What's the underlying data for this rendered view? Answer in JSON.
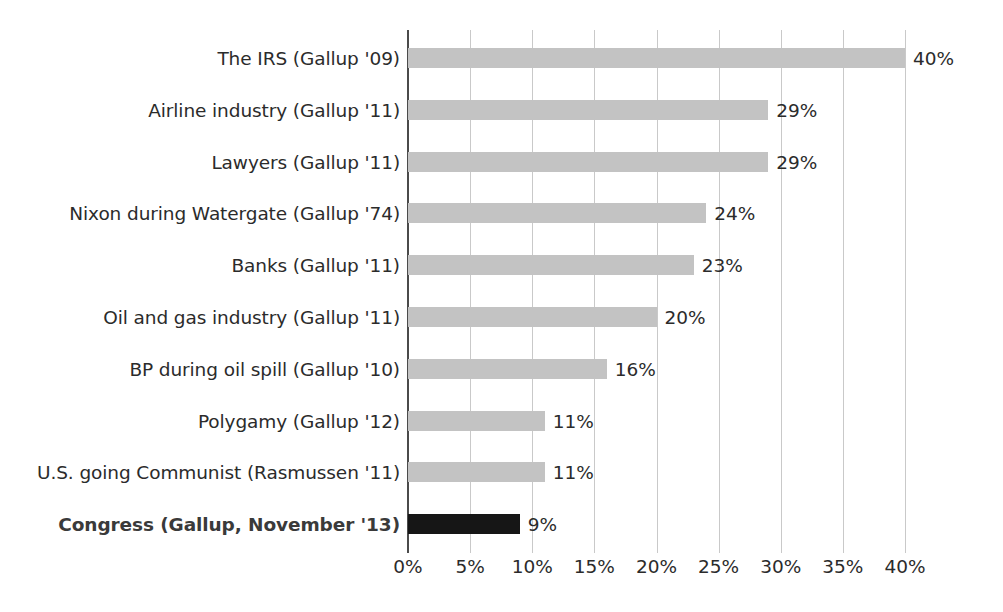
{
  "chart_data": {
    "type": "bar",
    "orientation": "horizontal",
    "title": "",
    "subtitle": "",
    "xlabel": "",
    "ylabel": "",
    "xlim": [
      0,
      40
    ],
    "xtick_step": 5,
    "grid": true,
    "legend": null,
    "value_suffix": "%",
    "categories": [
      "The IRS (Gallup '09)",
      "Airline industry (Gallup '11)",
      "Lawyers (Gallup '11)",
      "Nixon during Watergate (Gallup '74)",
      "Banks (Gallup '11)",
      "Oil and gas industry (Gallup '11)",
      "BP during oil spill (Gallup '10)",
      "Polygamy (Gallup '12)",
      "U.S. going Communist (Rasmussen '11)",
      "Congress (Gallup, November '13)"
    ],
    "values": [
      40,
      29,
      29,
      24,
      23,
      20,
      16,
      11,
      11,
      9
    ],
    "value_labels": [
      "40%",
      "29%",
      "29%",
      "24%",
      "23%",
      "20%",
      "16%",
      "11%",
      "11%",
      "9%"
    ],
    "highlight_index": 9,
    "xtick_labels": [
      "0%",
      "5%",
      "10%",
      "15%",
      "20%",
      "25%",
      "30%",
      "35%",
      "40%"
    ],
    "xtick_values": [
      0,
      5,
      10,
      15,
      20,
      25,
      30,
      35,
      40
    ],
    "colors": {
      "bar": "#c3c3c3",
      "bar_highlight": "#161616",
      "gridline": "#c9c9c9",
      "axis": "#4b4b4b",
      "text": "#2b2b2b",
      "background": "#ffffff"
    }
  }
}
